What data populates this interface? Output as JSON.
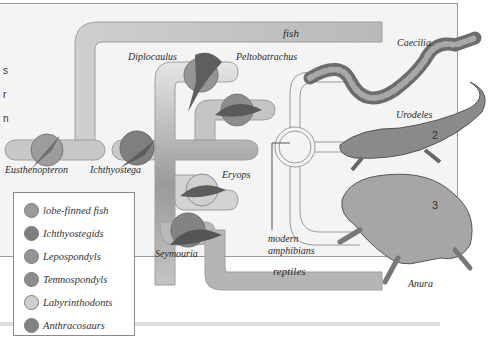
{
  "diagram": {
    "edge_fragments": [
      "s",
      "r",
      "n"
    ],
    "bands": {
      "fish": "fish",
      "reptiles": "reptiles",
      "modern_amphibians_line1": "modern",
      "modern_amphibians_line2": "amphibians"
    },
    "taxa": {
      "eusthenopteron": "Eusthenopteron",
      "ichthyostega": "Ichthyostega",
      "diplocaulus": "Diplocaulus",
      "peltobatrachus": "Peltobatrachus",
      "eryops": "Eryops",
      "seymouria": "Seymouria",
      "caecilia": "Caecilia",
      "urodeles": "Urodeles",
      "anura": "Anura"
    },
    "numbers": {
      "urodeles": "2",
      "anura": "3"
    }
  },
  "legend": {
    "items": [
      {
        "label": "lobe-finned fish",
        "color": "#9a9a9a"
      },
      {
        "label": "Ichthyostegids",
        "color": "#7e7e7e"
      },
      {
        "label": "Lepospondyls",
        "color": "#939393"
      },
      {
        "label": "Temnospondyls",
        "color": "#8c8c8c"
      },
      {
        "label": "Labyrinthodonts",
        "color": "#cfcfcf"
      },
      {
        "label": "Anthracosaurs",
        "color": "#828282"
      }
    ]
  },
  "colors": {
    "band": "#c6c6c6",
    "band_stroke": "#9e9e9e",
    "frame_bg": "#f4f4f4",
    "creature": "#6a6a6a"
  }
}
